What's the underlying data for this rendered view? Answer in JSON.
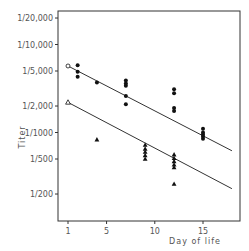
{
  "chart_data": {
    "type": "scatter",
    "title": "",
    "xlabel": "Day of life",
    "ylabel": "Titer",
    "yscale": "log",
    "x_ticks": [
      1,
      5,
      10,
      15
    ],
    "y_ticks": [
      {
        "label": "1/20,000",
        "value": 20000
      },
      {
        "label": "1/10,000",
        "value": 10000
      },
      {
        "label": "1/5,000",
        "value": 5000
      },
      {
        "label": "1/2,000",
        "value": 2000
      },
      {
        "label": "1/1000",
        "value": 1000
      },
      {
        "label": "1/500",
        "value": 500
      },
      {
        "label": "1/200",
        "value": 200
      }
    ],
    "xlim": [
      0,
      19
    ],
    "ylim": [
      120,
      25000
    ],
    "grid": false,
    "legend": null,
    "series": [
      {
        "name": "circles",
        "marker": "circle",
        "open_point": {
          "x": 1,
          "y": 5700
        },
        "points": [
          {
            "x": 2,
            "y": 5800
          },
          {
            "x": 2,
            "y": 4900
          },
          {
            "x": 2,
            "y": 4300
          },
          {
            "x": 4,
            "y": 3700
          },
          {
            "x": 7,
            "y": 3900
          },
          {
            "x": 7,
            "y": 3600
          },
          {
            "x": 7,
            "y": 3400
          },
          {
            "x": 7,
            "y": 2600
          },
          {
            "x": 7,
            "y": 2100
          },
          {
            "x": 12,
            "y": 3100
          },
          {
            "x": 12,
            "y": 2800
          },
          {
            "x": 12,
            "y": 1900
          },
          {
            "x": 12,
            "y": 1750
          },
          {
            "x": 15,
            "y": 1100
          },
          {
            "x": 15,
            "y": 1000
          },
          {
            "x": 15,
            "y": 950
          },
          {
            "x": 15,
            "y": 900
          },
          {
            "x": 15,
            "y": 850
          }
        ],
        "regression_line": {
          "x": [
            1,
            18
          ],
          "y": [
            5700,
            620
          ]
        }
      },
      {
        "name": "triangles",
        "marker": "triangle",
        "open_point": {
          "x": 1,
          "y": 2200
        },
        "points": [
          {
            "x": 4,
            "y": 830
          },
          {
            "x": 9,
            "y": 720
          },
          {
            "x": 9,
            "y": 650
          },
          {
            "x": 9,
            "y": 600
          },
          {
            "x": 9,
            "y": 550
          },
          {
            "x": 9,
            "y": 500
          },
          {
            "x": 12,
            "y": 560
          },
          {
            "x": 12,
            "y": 510
          },
          {
            "x": 12,
            "y": 470
          },
          {
            "x": 12,
            "y": 430
          },
          {
            "x": 12,
            "y": 400
          },
          {
            "x": 12,
            "y": 260
          }
        ],
        "regression_line": {
          "x": [
            1,
            18
          ],
          "y": [
            2200,
            230
          ]
        }
      }
    ]
  }
}
